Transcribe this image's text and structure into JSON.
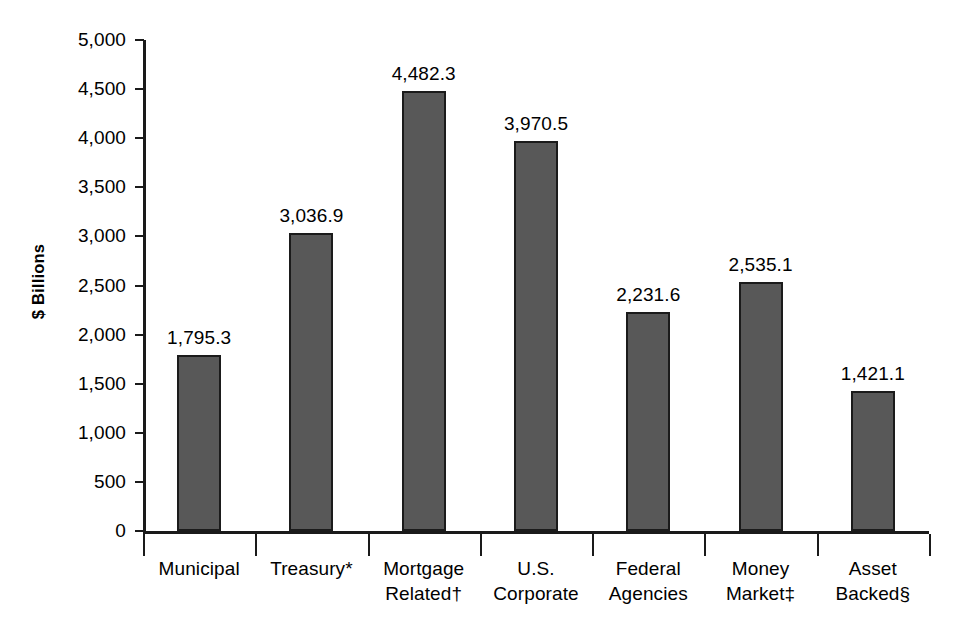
{
  "chart_data": {
    "type": "bar",
    "title": "",
    "subtitle": "",
    "xlabel": "",
    "ylabel": "$ Billions",
    "ylim": [
      0,
      5000
    ],
    "ytick_step": 500,
    "grid": false,
    "legend": false,
    "orientation": "vertical",
    "categories": [
      "Municipal",
      "Treasury*",
      "Mortgage Related†",
      "U.S. Corporate",
      "Federal Agencies",
      "Money Market‡",
      "Asset Backed§"
    ],
    "category_lines": [
      [
        "Municipal"
      ],
      [
        "Treasury*"
      ],
      [
        "Mortgage",
        "Related†"
      ],
      [
        "U.S.",
        "Corporate"
      ],
      [
        "Federal",
        "Agencies"
      ],
      [
        "Money",
        "Market‡"
      ],
      [
        "Asset",
        "Backed§"
      ]
    ],
    "values": [
      1795.3,
      3036.9,
      4482.3,
      3970.5,
      2231.6,
      2535.1,
      1421.1
    ],
    "value_labels": [
      "1,795.3",
      "3,036.9",
      "4,482.3",
      "3,970.5",
      "2,231.6",
      "2,535.1",
      "1,421.1"
    ],
    "ytick_labels": [
      "5,000",
      "4,500",
      "4,000",
      "3,500",
      "3,000",
      "2,500",
      "2,000",
      "1,500",
      "1,000",
      "500",
      "0"
    ],
    "ytick_values": [
      5000,
      4500,
      4000,
      3500,
      3000,
      2500,
      2000,
      1500,
      1000,
      500,
      0
    ],
    "colors": {
      "bar_fill": "#585858",
      "bar_stroke": "#1b1b1b",
      "axis": "#1a1a1a",
      "text": "#000000",
      "background": "#ffffff"
    }
  }
}
